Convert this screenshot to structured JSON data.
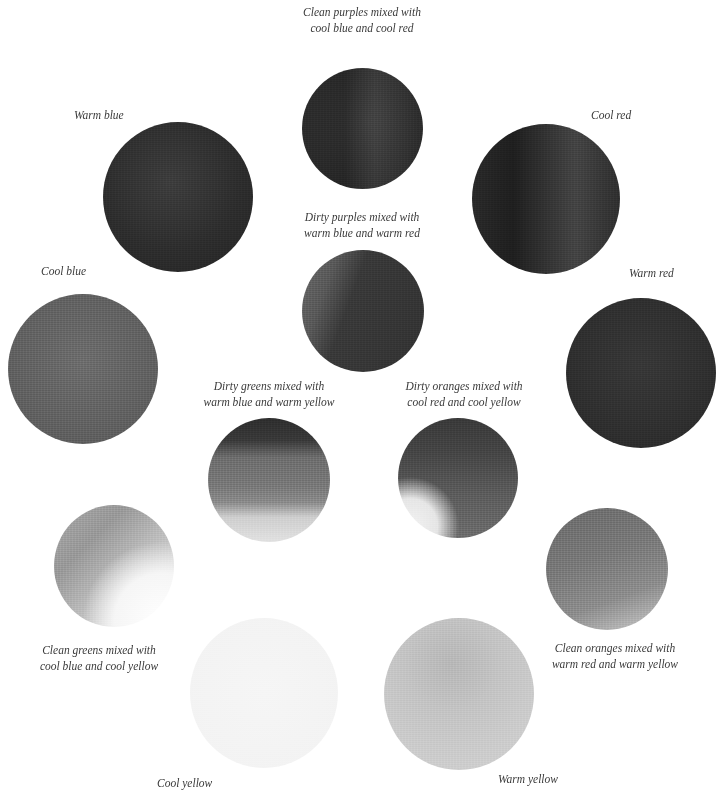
{
  "diagram": {
    "type": "watercolor-color-mixing-wheel",
    "swatches": [
      {
        "id": "clean-purples",
        "label_lines": [
          "Clean purples mixed with",
          "cool blue and cool red"
        ],
        "tone": "#2e2e2e"
      },
      {
        "id": "warm-blue",
        "label_lines": [
          "Warm blue"
        ],
        "tone": "#2e2e2e"
      },
      {
        "id": "cool-red",
        "label_lines": [
          "Cool red"
        ],
        "tone": "#2c2c2c"
      },
      {
        "id": "dirty-purples",
        "label_lines": [
          "Dirty purples mixed with",
          "warm blue and warm red"
        ],
        "tone": "#3e3e3e"
      },
      {
        "id": "cool-blue",
        "label_lines": [
          "Cool blue"
        ],
        "tone": "#626262"
      },
      {
        "id": "warm-red",
        "label_lines": [
          "Warm red"
        ],
        "tone": "#2f2f2f"
      },
      {
        "id": "dirty-greens",
        "label_lines": [
          "Dirty greens mixed with",
          "warm blue and warm yellow"
        ],
        "tone": "#7a7a7a"
      },
      {
        "id": "dirty-oranges",
        "label_lines": [
          "Dirty oranges mixed with",
          "cool red and cool yellow"
        ],
        "tone": "#505050"
      },
      {
        "id": "clean-greens",
        "label_lines": [
          "Clean greens mixed with",
          "cool blue and cool yellow"
        ],
        "tone": "#b0b0b0"
      },
      {
        "id": "clean-oranges",
        "label_lines": [
          "Clean oranges mixed with",
          "warm red and warm yellow"
        ],
        "tone": "#808080"
      },
      {
        "id": "cool-yellow",
        "label_lines": [
          "Cool yellow"
        ],
        "tone": "#f3f3f3"
      },
      {
        "id": "warm-yellow",
        "label_lines": [
          "Warm yellow"
        ],
        "tone": "#c8c8c8"
      }
    ]
  },
  "labels": {
    "clean_purples": [
      "Clean purples mixed with",
      "cool blue and cool red"
    ],
    "warm_blue": "Warm blue",
    "cool_red": "Cool red",
    "dirty_purples": [
      "Dirty purples mixed with",
      "warm blue and warm red"
    ],
    "cool_blue": "Cool blue",
    "warm_red": "Warm red",
    "dirty_greens": [
      "Dirty greens mixed with",
      "warm blue and warm yellow"
    ],
    "dirty_oranges": [
      "Dirty oranges mixed with",
      "cool red and cool yellow"
    ],
    "clean_greens": [
      "Clean greens mixed with",
      "cool blue and cool yellow"
    ],
    "clean_oranges": [
      "Clean oranges mixed with",
      "warm red and warm yellow"
    ],
    "cool_yellow": "Cool yellow",
    "warm_yellow": "Warm yellow"
  },
  "colors": {
    "background": "#ffffff",
    "label_text": "#3a3a3a"
  }
}
